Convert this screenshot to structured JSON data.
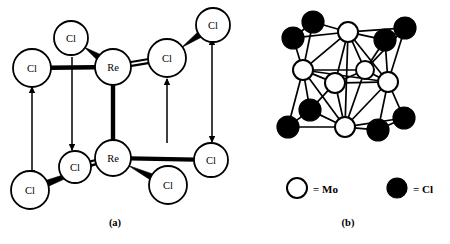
{
  "figure": {
    "background_color": "#ffffff",
    "stroke_color": "#000000",
    "atom_fill_color": "#ffffff",
    "cl_fill_color": "#000000"
  },
  "panels": [
    {
      "id": "panel-a",
      "caption": "(a)",
      "caption_x": 115,
      "caption_y": 222,
      "description": "Re2Cl8 dimer unit with axial arrows",
      "atoms": [
        {
          "label": "Cl",
          "x": 71,
          "y": 38,
          "r": 17,
          "kind": "open"
        },
        {
          "label": "Cl",
          "x": 32,
          "y": 68,
          "r": 19,
          "kind": "open"
        },
        {
          "label": "Re",
          "x": 113,
          "y": 67,
          "r": 18,
          "kind": "open"
        },
        {
          "label": "Cl",
          "x": 167,
          "y": 58,
          "r": 19,
          "kind": "open"
        },
        {
          "label": "Cl",
          "x": 213,
          "y": 25,
          "r": 17,
          "kind": "open"
        },
        {
          "label": "Re",
          "x": 113,
          "y": 158,
          "r": 18,
          "kind": "open"
        },
        {
          "label": "Cl",
          "x": 75,
          "y": 167,
          "r": 16,
          "kind": "open"
        },
        {
          "label": "Cl",
          "x": 30,
          "y": 190,
          "r": 19,
          "kind": "open"
        },
        {
          "label": "Cl",
          "x": 168,
          "y": 185,
          "r": 19,
          "kind": "open"
        },
        {
          "label": "Cl",
          "x": 211,
          "y": 160,
          "r": 17,
          "kind": "open"
        }
      ],
      "bonds": [
        {
          "from": 1,
          "to": 2,
          "style": "thick"
        },
        {
          "from": 0,
          "to": 2,
          "style": "wedge"
        },
        {
          "from": 2,
          "to": 3,
          "style": "double"
        },
        {
          "from": 3,
          "to": 4,
          "style": "wedge"
        },
        {
          "from": 2,
          "to": 5,
          "style": "thick"
        },
        {
          "from": 5,
          "to": 6,
          "style": "double"
        },
        {
          "from": 5,
          "to": 7,
          "style": "wedge"
        },
        {
          "from": 5,
          "to": 8,
          "style": "wedge"
        },
        {
          "from": 5,
          "to": 9,
          "style": "thick"
        }
      ],
      "arrows": [
        {
          "from_x": 32,
          "from_y": 171,
          "to_x": 32,
          "to_y": 87,
          "head": "both"
        },
        {
          "from_x": 72,
          "from_y": 57,
          "to_x": 72,
          "to_y": 150,
          "head": "end"
        },
        {
          "from_x": 167,
          "from_y": 143,
          "to_x": 167,
          "to_y": 79,
          "head": "end"
        },
        {
          "from_x": 212,
          "from_y": 44,
          "to_x": 212,
          "to_y": 142,
          "head": "both"
        }
      ]
    },
    {
      "id": "panel-b",
      "caption": "(b)",
      "caption_x": 348,
      "caption_y": 222,
      "description": "Mo6Cl8 cluster: octahedron of Mo atoms capped by eight Cl atoms",
      "atoms": [
        {
          "label": "Mo",
          "x": 313,
          "y": 22,
          "r": 11,
          "kind": "filled"
        },
        {
          "label": "Cl",
          "x": 293,
          "y": 38,
          "r": 11,
          "kind": "filled"
        },
        {
          "label": "Mo",
          "x": 348,
          "y": 32,
          "r": 10,
          "kind": "open"
        },
        {
          "label": "Cl",
          "x": 385,
          "y": 40,
          "r": 11,
          "kind": "filled"
        },
        {
          "label": "Cl",
          "x": 405,
          "y": 28,
          "r": 11,
          "kind": "filled"
        },
        {
          "label": "Mo",
          "x": 303,
          "y": 70,
          "r": 10,
          "kind": "open"
        },
        {
          "label": "Mo",
          "x": 335,
          "y": 83,
          "r": 10,
          "kind": "open"
        },
        {
          "label": "Mo",
          "x": 365,
          "y": 70,
          "r": 9,
          "kind": "open"
        },
        {
          "label": "Mo",
          "x": 388,
          "y": 82,
          "r": 10,
          "kind": "open"
        },
        {
          "label": "Cl",
          "x": 310,
          "y": 110,
          "r": 11,
          "kind": "filled"
        },
        {
          "label": "Cl",
          "x": 288,
          "y": 127,
          "r": 11,
          "kind": "filled"
        },
        {
          "label": "Mo",
          "x": 345,
          "y": 127,
          "r": 10,
          "kind": "open"
        },
        {
          "label": "Cl",
          "x": 378,
          "y": 130,
          "r": 11,
          "kind": "filled"
        },
        {
          "label": "Cl",
          "x": 404,
          "y": 118,
          "r": 11,
          "kind": "filled"
        }
      ],
      "cl_indices": [
        0,
        1,
        3,
        4,
        9,
        10,
        12,
        13
      ],
      "mo_indices": [
        2,
        5,
        6,
        7,
        8,
        11
      ]
    }
  ],
  "legend": {
    "items": [
      {
        "symbol": "open",
        "text": "= Mo",
        "circle_x": 297,
        "circle_y": 188,
        "text_x": 313,
        "text_y": 189,
        "r": 10
      },
      {
        "symbol": "filled",
        "text": "= Cl",
        "circle_x": 397,
        "circle_y": 188,
        "text_x": 413,
        "text_y": 189,
        "r": 10
      }
    ]
  }
}
